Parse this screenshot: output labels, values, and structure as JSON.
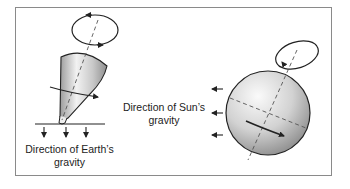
{
  "figure": {
    "left_panel": {
      "subject": "spinning top",
      "label_line1": "Direction of Earth’s",
      "label_line2": "gravity",
      "gravity_arrows": 3,
      "gravity_arrow_direction": "down"
    },
    "right_panel": {
      "subject": "spinning sphere (Earth)",
      "label_line1": "Direction of Sun’s",
      "label_line2": "gravity",
      "gravity_arrows": 3,
      "gravity_arrow_direction": "left"
    },
    "colors": {
      "stroke": "#222222",
      "frame": "#8a8a8a",
      "shade_light": "#f4f4f4",
      "shade_dark": "#9a9a9a"
    }
  }
}
